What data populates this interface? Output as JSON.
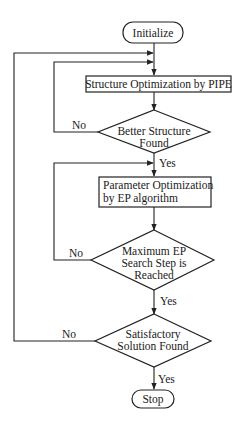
{
  "flowchart": {
    "nodes": {
      "start": {
        "type": "terminal",
        "label": "Initialize"
      },
      "structure_opt": {
        "type": "process",
        "label": "Structure Optimization by PIPE"
      },
      "better_structure": {
        "type": "decision",
        "lines": [
          "Better Structure",
          "Found"
        ]
      },
      "param_opt": {
        "type": "process",
        "lines": [
          "Parameter Optimization",
          "by EP algorithm"
        ]
      },
      "max_ep": {
        "type": "decision",
        "lines": [
          "Maximum EP",
          "Search Step is",
          "Reached"
        ]
      },
      "satisfactory": {
        "type": "decision",
        "lines": [
          "Satisfactory",
          "Solution Found"
        ]
      },
      "stop": {
        "type": "terminal",
        "label": "Stop"
      }
    },
    "edge_labels": {
      "better_yes": "Yes",
      "better_no": "No",
      "max_yes": "Yes",
      "max_no": "No",
      "sat_yes": "Yes",
      "sat_no": "No"
    }
  }
}
